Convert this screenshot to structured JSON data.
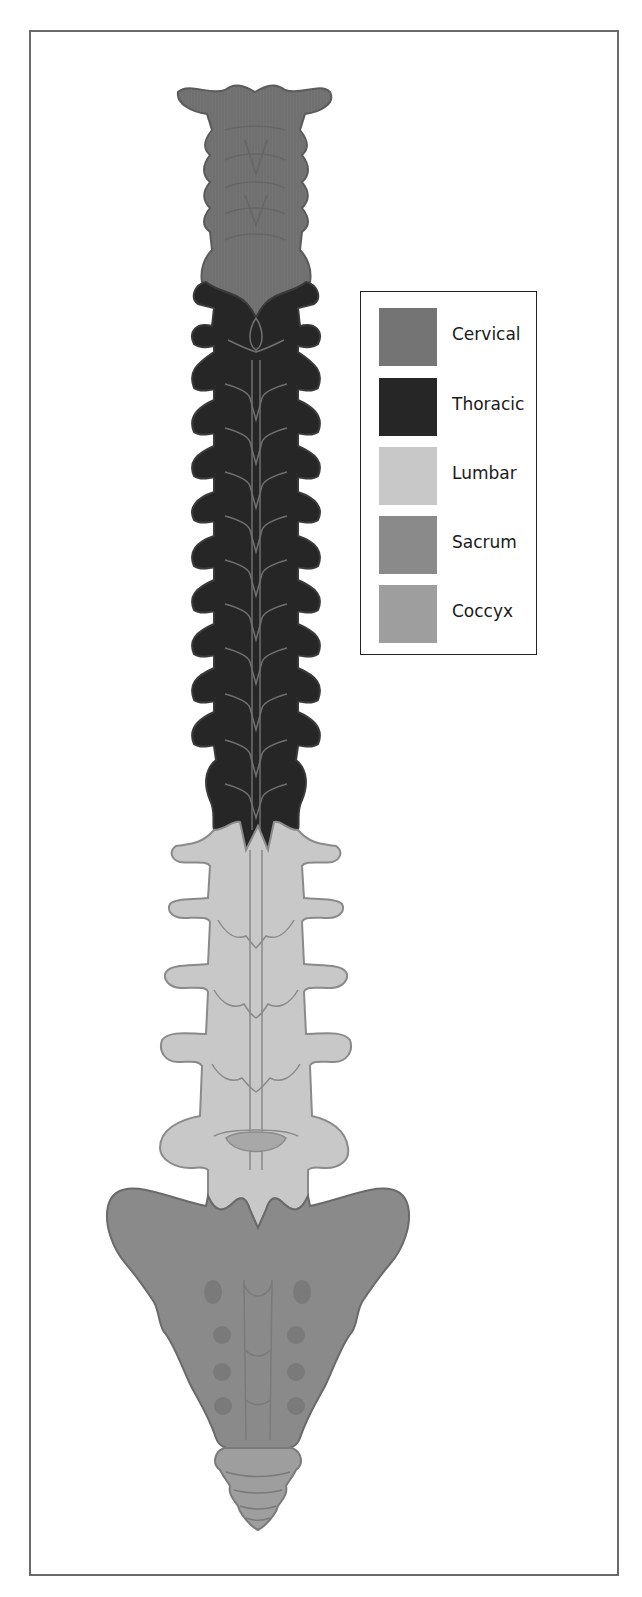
{
  "figure": {
    "regions": [
      {
        "key": "cervical",
        "label": "Cervical",
        "color": "#747474"
      },
      {
        "key": "thoracic",
        "label": "Thoracic",
        "color": "#262626"
      },
      {
        "key": "lumbar",
        "label": "Lumbar",
        "color": "#c8c8c8"
      },
      {
        "key": "sacrum",
        "label": "Sacrum",
        "color": "#8a8a8a"
      },
      {
        "key": "coccyx",
        "label": "Coccyx",
        "color": "#9e9e9e"
      }
    ]
  },
  "legend": {
    "items": [
      {
        "label": "Cervical",
        "color": "#747474"
      },
      {
        "label": "Thoracic",
        "color": "#262626"
      },
      {
        "label": "Lumbar",
        "color": "#c8c8c8"
      },
      {
        "label": "Sacrum",
        "color": "#8a8a8a"
      },
      {
        "label": "Coccyx",
        "color": "#9e9e9e"
      }
    ]
  }
}
